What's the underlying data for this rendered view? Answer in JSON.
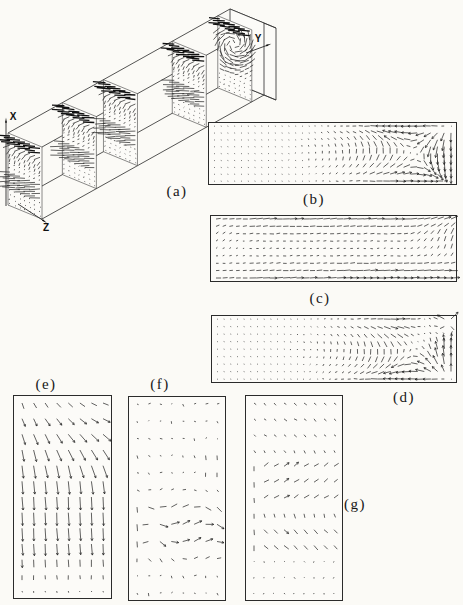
{
  "labels": {
    "a": "(a)",
    "b": "(b)",
    "c": "(c)",
    "d": "(d)",
    "e": "(e)",
    "f": "(f)",
    "g": "(g)"
  },
  "axis_labels": {
    "x": "X",
    "y": "Y",
    "z": "Z"
  },
  "colors": {
    "paper": "#fbfaf6",
    "ink": "#1c1c1c",
    "panel_border": "#2b2b2b",
    "panel_fill": "#fcfbf8"
  },
  "chart_data": [
    {
      "id": "a",
      "label": "(a)",
      "type": "quiver-3d-duct",
      "legend_position": "below-duct",
      "description": "Oblique wireframe of a long rectangular duct with five transverse cross-section planes, each showing a secondary-flow vector field: dense dark band of long arrows at the top of every plane, arrows curving downward beneath it, long leftward arrows at mid-height overhanging the plane edge, sparse dots near the bottom; the end face shows a swirling vortex.",
      "axes": {
        "x": "X (up)",
        "y": "Y (along duct, to upper right)",
        "z": "Z (to lower left front)"
      },
      "sections": {
        "count": 5,
        "positions_frac": [
          0,
          0.245,
          0.43,
          0.74,
          0.945
        ],
        "grid": {
          "cols": 7,
          "rows": 16
        }
      },
      "duct": {
        "front_top_left": [
          8,
          133
        ],
        "width_vec": [
          34,
          14
        ],
        "height_vec": [
          0,
          72
        ],
        "length_vec": [
          222,
          -124
        ],
        "end_cap_offset": [
          12,
          5
        ]
      }
    },
    {
      "id": "b",
      "label": "(b)",
      "type": "quiver",
      "grid": {
        "cols": 36,
        "rows": 9
      },
      "model": "cavity-recirculation",
      "vortex_center_frac": [
        0.84,
        0.5
      ],
      "max_arrow_px": 11,
      "description": "Long horizontal plane: single recirculation cell — long arrows leftward along the top, rightward along the bottom, nearly stagnant core, strong curling vortex at the right end, tiny ticks at the left wall."
    },
    {
      "id": "c",
      "label": "(c)",
      "type": "quiver",
      "grid": {
        "cols": 36,
        "rows": 9
      },
      "model": "parallel-stream",
      "max_arrow_px": 10,
      "description": "Long horizontal plane: nearly parallel horizontal arrows, longer near top and bottom walls, short in the core; oblique upward arrows near the right end and a slight upward tilt at the left wall."
    },
    {
      "id": "d",
      "label": "(d)",
      "type": "quiver",
      "grid": {
        "cols": 36,
        "rows": 9
      },
      "model": "cavity-recirculation-mirrored-corner-fan",
      "fan_corner_frac": [
        1,
        0
      ],
      "max_arrow_px": 11,
      "description": "Long horizontal plane: recirculation mirrored vertically relative to (b) with a dark radiating fan of arrows at the top-right corner and oblique arrows beneath it."
    },
    {
      "id": "e",
      "label": "(e)",
      "type": "quiver",
      "grid": {
        "cols": 8,
        "rows": 13
      },
      "model": "turning-downward-jet",
      "max_arrow_px": 13,
      "description": "Tall vertical plane: arrows enter pointing right-and-down at the top (steeper at the left column), turn to long straight downward arrows through the middle, and shrink to dots at the bottom."
    },
    {
      "id": "f",
      "label": "(f)",
      "type": "quiver",
      "grid": {
        "cols": 8,
        "rows": 12
      },
      "model": "meander-band",
      "band_frac": [
        0.4,
        0.9
      ],
      "max_arrow_px": 9,
      "description": "Tall vertical plane: tiny arrows over the upper half, short vertical bars near the right edge, and a wavy meandering band of longer horizontal arrows across the lower half, fading to dots at the bottom."
    },
    {
      "id": "g",
      "label": "(g)",
      "type": "quiver",
      "grid": {
        "cols": 9,
        "rows": 13
      },
      "model": "alternating-shear",
      "max_arrow_px": 7,
      "description": "Tall vertical plane: short down-right arrows at the top, a band of up-right arrows at mid-height, a band of down-right arrows below it, vertical bars at the left edge and dots near top and bottom."
    }
  ],
  "panels": {
    "b": {
      "x": 208,
      "y": 122,
      "w": 249,
      "h": 63,
      "label_pos": [
        314,
        199
      ]
    },
    "c": {
      "x": 210,
      "y": 215,
      "w": 247,
      "h": 67,
      "label_pos": [
        320,
        298
      ]
    },
    "d": {
      "x": 211,
      "y": 315,
      "w": 246,
      "h": 68,
      "label_pos": [
        404,
        397
      ]
    },
    "e": {
      "x": 13,
      "y": 395,
      "w": 99,
      "h": 204,
      "label_pos": [
        46,
        384
      ]
    },
    "f": {
      "x": 128,
      "y": 396,
      "w": 98,
      "h": 205,
      "label_pos": [
        160,
        384
      ]
    },
    "g": {
      "x": 245,
      "y": 395,
      "w": 98,
      "h": 206,
      "label_pos": [
        355,
        504
      ]
    },
    "a": {
      "label_pos": [
        177,
        191
      ]
    }
  },
  "axes_geometry": {
    "x": {
      "from": [
        6,
        206
      ],
      "to": [
        6,
        121
      ],
      "label_pos": [
        13,
        116
      ]
    },
    "y": {
      "from": [
        246,
        53
      ],
      "to": [
        268,
        45
      ],
      "label_pos": [
        258,
        38
      ]
    },
    "z": {
      "from": [
        18,
        204
      ],
      "to": [
        44,
        221
      ],
      "label_pos": [
        46,
        227
      ]
    }
  }
}
